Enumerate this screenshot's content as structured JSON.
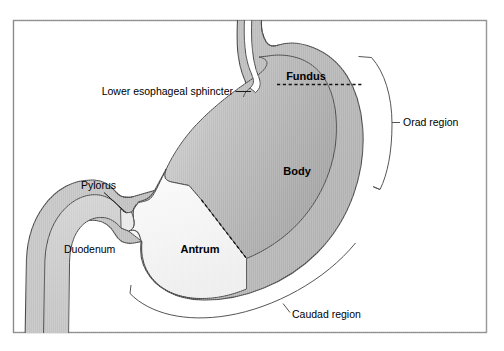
{
  "figure": {
    "kind": "anatomical-diagram",
    "background_color": "#ffffff",
    "frame_color": "#8a8a8a"
  },
  "labels": {
    "fundus": "Fundus",
    "body": "Body",
    "antrum": "Antrum",
    "duodenum": "Duodenum",
    "pylorus": "Pylorus",
    "lower_esophageal_sphincter": "Lower esophageal sphincter",
    "orad_region": "Orad region",
    "caudad_region": "Caudad region"
  },
  "palette": {
    "body_fill_dark": "#a9a9a9",
    "body_fill_light": "#d2d2d2",
    "antrum_fill": "#f2f2f2",
    "wall_fill": "#c2c2c2",
    "duodenum_fill": "#c8c8c8",
    "outline": "#4a4a4a",
    "dashed_divider": "#111111",
    "leader_line": "#1a1a1a",
    "bracket": "#555555"
  }
}
